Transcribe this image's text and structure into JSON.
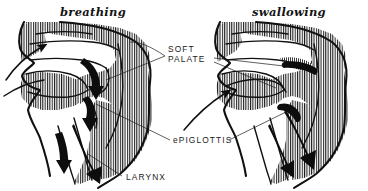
{
  "figure": {
    "title_left": "breathing",
    "title_right": "swallowing",
    "background_color": "#ffffff",
    "ink_color": "#111111"
  },
  "labels": {
    "soft_palate_line1": "SOFT",
    "soft_palate_line2": "PALATE",
    "epiglottis": "ePIGLOTTIS",
    "larynx": "LARYNX"
  },
  "panels": [
    {
      "name": "breathing",
      "title": "breathing",
      "description": "Sagittal head section, soft palate lowered, airway open, arrows show air passing from nostril and mouth down through pharynx into larynx"
    },
    {
      "name": "swallowing",
      "title": "swallowing",
      "description": "Sagittal head section, soft palate raised closing nasal passage, epiglottis folded over larynx, arrow shows bolus passing down oesophagus"
    }
  ]
}
